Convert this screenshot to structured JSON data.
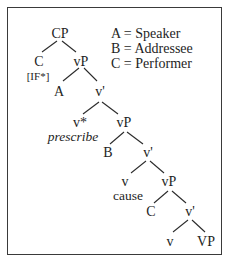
{
  "figure": {
    "type": "syntax-tree",
    "legend": [
      {
        "symbol": "A",
        "meaning": "Speaker",
        "text": "A = Speaker"
      },
      {
        "symbol": "B",
        "meaning": "Addressee",
        "text": "B = Addressee"
      },
      {
        "symbol": "C",
        "meaning": "Performer",
        "text": "C = Performer"
      }
    ],
    "nodes": {
      "cp": "CP",
      "c": "C",
      "c_feature": "[IF*]",
      "vp1": "vP",
      "a": "A",
      "vbar1": "v'",
      "vstar": "v*",
      "vstar_gloss": "prescribe",
      "vp2": "vP",
      "b": "B",
      "vbar2": "v'",
      "v1": "v",
      "v1_gloss": "cause",
      "vp3": "vP",
      "c2": "C",
      "vbar3": "v'",
      "v2": "v",
      "vp_final": "VP"
    },
    "colors": {
      "ink": "#1e1e1e",
      "border": "#3a3a3a",
      "background": "#ffffff"
    }
  }
}
